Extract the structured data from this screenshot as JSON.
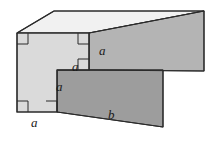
{
  "figure": {
    "type": "geometry-diagram",
    "background_color": "#ffffff",
    "colors": {
      "face_front_l_shape": "#d9d9d9",
      "face_top": "#f0f0f0",
      "face_side_upper": "#b3b3b3",
      "face_side_lower": "#9e9e9e",
      "face_step_top": "#c4c4c4",
      "outline": "#2b2b2b",
      "right_angle_mark": "#2b2b2b",
      "label_color": "#1a1a1a"
    },
    "labels": [
      {
        "id": "a-upper-right",
        "text": "a",
        "x": 101,
        "y": 48
      },
      {
        "id": "a-step-top",
        "text": "a",
        "x": 74,
        "y": 65
      },
      {
        "id": "a-step-left",
        "text": "a",
        "x": 57,
        "y": 85
      },
      {
        "id": "a-bottom-front",
        "text": "a",
        "x": 32,
        "y": 121
      },
      {
        "id": "b-bottom-edge",
        "text": "b",
        "x": 110,
        "y": 113
      }
    ],
    "right_angle_marks": [
      {
        "id": "corner-top-left",
        "x": 18,
        "y": 35
      },
      {
        "id": "corner-top-right",
        "x": 83,
        "y": 34
      },
      {
        "id": "corner-step-inner",
        "x": 83,
        "y": 62
      },
      {
        "id": "corner-bottom-left",
        "x": 18,
        "y": 103
      },
      {
        "id": "corner-bottom-right",
        "x": 48,
        "y": 103
      }
    ],
    "geometry": {
      "front_l_shape": "17,33 89,33 89,70 57,70 57,112 17,112",
      "top_face": "17,33 54,10 204,10 89,33",
      "side_upper": "89,33 204,10 204,72 89,70",
      "side_lower": "57,70 163,70 163,127 57,112",
      "step_top": "57,70 89,70 163,70 163,70"
    }
  }
}
